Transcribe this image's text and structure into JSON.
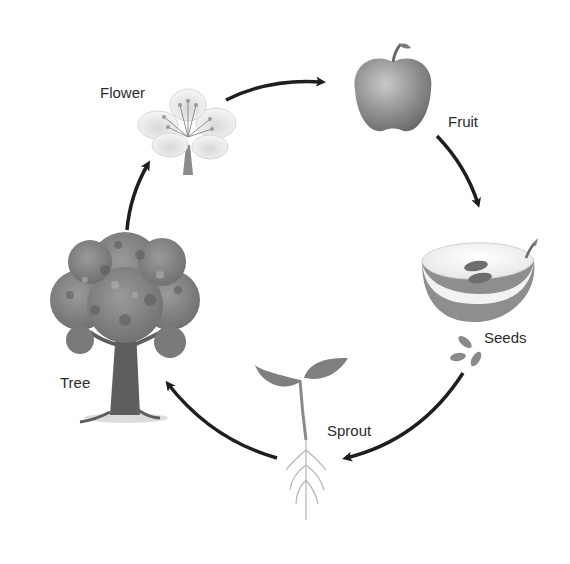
{
  "diagram": {
    "type": "cycle",
    "stages": [
      {
        "id": "flower",
        "label": "Flower",
        "icon": "flower-icon"
      },
      {
        "id": "fruit",
        "label": "Fruit",
        "icon": "apple-icon"
      },
      {
        "id": "seeds",
        "label": "Seeds",
        "icon": "halved-apple-seeds-icon"
      },
      {
        "id": "sprout",
        "label": "Sprout",
        "icon": "sprout-icon"
      },
      {
        "id": "tree",
        "label": "Tree",
        "icon": "tree-icon"
      }
    ],
    "arrows": [
      {
        "from": "flower",
        "to": "fruit"
      },
      {
        "from": "fruit",
        "to": "seeds"
      },
      {
        "from": "seeds",
        "to": "sprout"
      },
      {
        "from": "sprout",
        "to": "tree"
      },
      {
        "from": "tree",
        "to": "flower"
      }
    ],
    "colors": {
      "background": "#ffffff",
      "arrow": "#1e1e1e",
      "label": "#2b2b2b"
    }
  }
}
